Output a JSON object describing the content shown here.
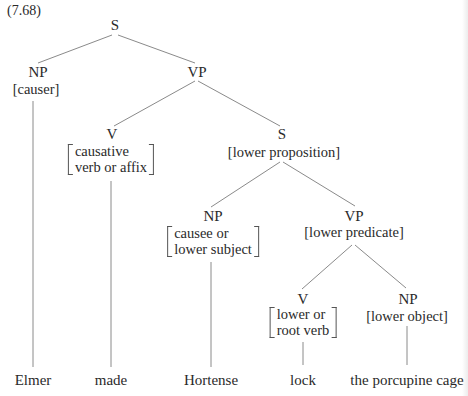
{
  "example_number": "(7.68)",
  "tree": {
    "root": {
      "category": "S"
    },
    "causer_np": {
      "category": "NP",
      "feature": "[causer]",
      "word": "Elmer"
    },
    "vp": {
      "category": "VP"
    },
    "causative_v": {
      "category": "V",
      "feature_lines": [
        "causative",
        "verb or affix"
      ],
      "word": "made"
    },
    "lower_s": {
      "category": "S",
      "feature": "[lower proposition]"
    },
    "causee_np": {
      "category": "NP",
      "feature_lines": [
        "causee or",
        "lower subject"
      ],
      "word": "Hortense"
    },
    "lower_vp": {
      "category": "VP",
      "feature": "[lower predicate]"
    },
    "root_v": {
      "category": "V",
      "feature_lines": [
        "lower or",
        "root verb"
      ],
      "word": "lock"
    },
    "object_np": {
      "category": "NP",
      "feature": "[lower object]",
      "word": "the porcupine cage"
    }
  },
  "colors": {
    "lines": "#8a8a8a",
    "text": "#2a2a2a",
    "background": "#ffffff"
  }
}
